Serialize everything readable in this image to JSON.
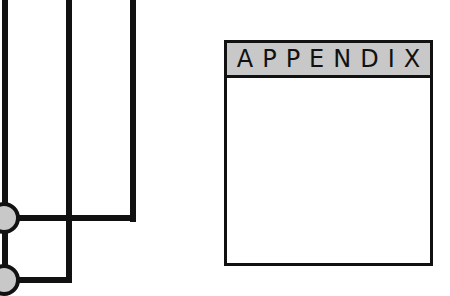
{
  "appendix": {
    "title": "APPENDIX"
  },
  "colors": {
    "stroke": "#111111",
    "fill": "#c8c8c8",
    "background": "#ffffff"
  }
}
